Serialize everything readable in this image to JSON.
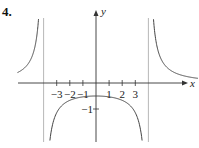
{
  "problem_number": "4.",
  "chart_data": {
    "type": "line",
    "title": "",
    "xlabel": "x",
    "ylabel": "y",
    "x_ticks": [
      -3,
      -2,
      -1,
      1,
      2,
      3
    ],
    "x_tick_labels": [
      "−3",
      "−2",
      "−1",
      "1",
      "2",
      "3"
    ],
    "y_ticks": [
      -1
    ],
    "y_tick_labels": [
      "−1"
    ],
    "vertical_asymptotes": [
      -4,
      4
    ],
    "xlim": [
      -6.5,
      8.5
    ],
    "ylim": [
      -4.7,
      3.1
    ],
    "grid": false,
    "series": [
      {
        "name": "f(x)",
        "description": "y = 8/(x^2 - 16)",
        "y_intercept": -0.5
      }
    ]
  }
}
